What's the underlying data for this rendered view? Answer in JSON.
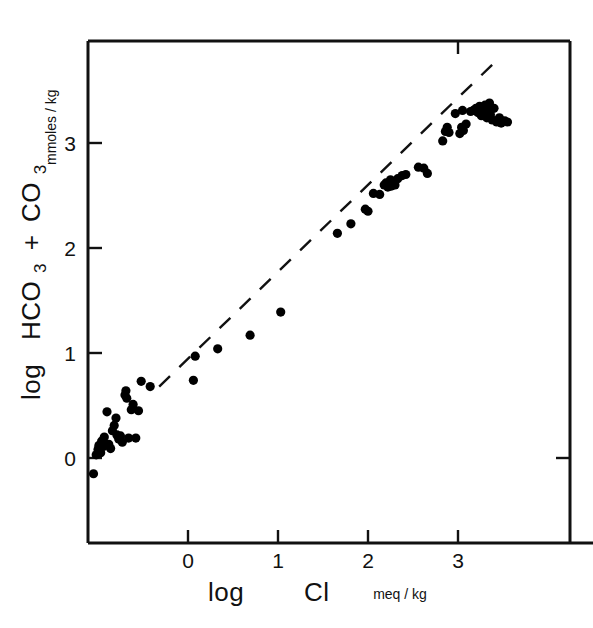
{
  "figure": {
    "background_color": "#ffffff",
    "ink_color": "#111111",
    "marker_color": "#000000"
  },
  "chart_data": {
    "type": "scatter",
    "title": "",
    "subtitle": "",
    "xlabel": "log  Cl",
    "xlabel_units": "meq / kg",
    "ylabel": "log  HCO3 + CO3",
    "ylabel_units": "mmoles / kg",
    "ylabel_parts": {
      "log": "log",
      "hco3": "HCO",
      "hco3_sub": "3",
      "plus": "+",
      "co3": "CO",
      "co3_sub": "3"
    },
    "xticks": [
      0,
      1,
      2,
      3
    ],
    "xtick_labels": [
      "0",
      "1",
      "2",
      "3"
    ],
    "yticks": [
      0,
      1,
      2,
      3
    ],
    "ytick_labels": [
      "0",
      "1",
      "2",
      "3"
    ],
    "xlim": [
      -1.12,
      3.71
    ],
    "ylim": [
      -0.83,
      3.91
    ],
    "grid": false,
    "legend": false,
    "legend_position": "none",
    "reference_line": {
      "style": "dashed",
      "label": "",
      "x_start": -0.32,
      "y_start": 0.68,
      "x_end": 3.41,
      "y_end": 3.77
    },
    "series": [
      {
        "name": "samples",
        "marker": "filled-circle",
        "color": "#000000",
        "points": [
          [
            -1.05,
            -0.15
          ],
          [
            -1.02,
            0.03
          ],
          [
            -1.0,
            0.08
          ],
          [
            -0.99,
            0.12
          ],
          [
            -0.97,
            0.05
          ],
          [
            -0.96,
            0.16
          ],
          [
            -0.94,
            0.11
          ],
          [
            -0.93,
            0.2
          ],
          [
            -0.9,
            0.44
          ],
          [
            -0.88,
            0.13
          ],
          [
            -0.86,
            0.09
          ],
          [
            -0.84,
            0.26
          ],
          [
            -0.82,
            0.31
          ],
          [
            -0.8,
            0.38
          ],
          [
            -0.79,
            0.22
          ],
          [
            -0.77,
            0.18
          ],
          [
            -0.75,
            0.21
          ],
          [
            -0.73,
            0.15
          ],
          [
            -0.7,
            0.6
          ],
          [
            -0.69,
            0.64
          ],
          [
            -0.68,
            0.57
          ],
          [
            -0.66,
            0.19
          ],
          [
            -0.63,
            0.46
          ],
          [
            -0.61,
            0.51
          ],
          [
            -0.58,
            0.19
          ],
          [
            -0.55,
            0.45
          ],
          [
            -0.52,
            0.73
          ],
          [
            -0.42,
            0.68
          ],
          [
            0.06,
            0.74
          ],
          [
            0.08,
            0.97
          ],
          [
            0.33,
            1.04
          ],
          [
            0.69,
            1.17
          ],
          [
            1.03,
            1.39
          ],
          [
            1.66,
            2.14
          ],
          [
            1.81,
            2.23
          ],
          [
            1.97,
            2.37
          ],
          [
            2.0,
            2.35
          ],
          [
            2.06,
            2.52
          ],
          [
            2.13,
            2.51
          ],
          [
            2.18,
            2.6
          ],
          [
            2.2,
            2.62
          ],
          [
            2.22,
            2.58
          ],
          [
            2.24,
            2.61
          ],
          [
            2.25,
            2.65
          ],
          [
            2.26,
            2.59
          ],
          [
            2.28,
            2.63
          ],
          [
            2.3,
            2.6
          ],
          [
            2.33,
            2.66
          ],
          [
            2.38,
            2.69
          ],
          [
            2.42,
            2.7
          ],
          [
            2.56,
            2.77
          ],
          [
            2.62,
            2.76
          ],
          [
            2.66,
            2.71
          ],
          [
            2.83,
            3.02
          ],
          [
            2.86,
            3.11
          ],
          [
            2.88,
            3.15
          ],
          [
            2.9,
            3.1
          ],
          [
            2.97,
            3.28
          ],
          [
            3.02,
            3.09
          ],
          [
            3.04,
            3.15
          ],
          [
            3.05,
            3.31
          ],
          [
            3.06,
            3.12
          ],
          [
            3.09,
            3.18
          ],
          [
            3.14,
            3.3
          ],
          [
            3.17,
            3.31
          ],
          [
            3.2,
            3.33
          ],
          [
            3.22,
            3.29
          ],
          [
            3.24,
            3.35
          ],
          [
            3.26,
            3.26
          ],
          [
            3.28,
            3.3
          ],
          [
            3.3,
            3.36
          ],
          [
            3.32,
            3.24
          ],
          [
            3.33,
            3.31
          ],
          [
            3.35,
            3.38
          ],
          [
            3.36,
            3.27
          ],
          [
            3.38,
            3.22
          ],
          [
            3.4,
            3.33
          ],
          [
            3.43,
            3.2
          ],
          [
            3.46,
            3.24
          ],
          [
            3.48,
            3.19
          ],
          [
            3.52,
            3.21
          ],
          [
            3.55,
            3.2
          ]
        ]
      }
    ]
  }
}
